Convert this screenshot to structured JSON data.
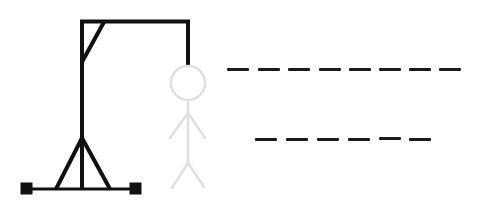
{
  "game": {
    "name": "Hangman",
    "colors": {
      "gallows": "#111111",
      "figure": "#e0e0e0",
      "blank": "#1a1a1a",
      "background": "#ffffff"
    },
    "figure_parts": [
      "head",
      "body",
      "left-arm",
      "right-arm",
      "left-leg",
      "right-leg"
    ],
    "words": [
      {
        "row": 1,
        "letter_count": 8,
        "letters": [
          "",
          "",
          "",
          "",
          "",
          "",
          "",
          ""
        ]
      },
      {
        "row": 2,
        "letter_count": 6,
        "letters": [
          "",
          "",
          "",
          "",
          "",
          ""
        ]
      }
    ]
  }
}
